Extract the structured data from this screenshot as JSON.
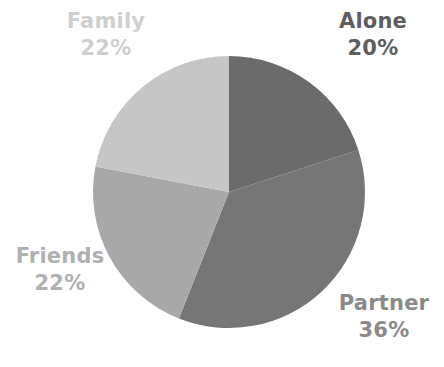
{
  "chart_data": {
    "type": "pie",
    "title": "",
    "subtitle": "",
    "xlabel": "",
    "ylabel": "",
    "legend_position": "none",
    "grid": false,
    "labels_shown": "category-and-percent",
    "start_angle_deg": 0,
    "direction": "clockwise",
    "background_color": "#ffffff",
    "categories": [
      "Alone",
      "Partner",
      "Friends",
      "Family"
    ],
    "values": [
      20,
      36,
      22,
      22
    ],
    "unit": "%",
    "slices": [
      {
        "label": "Alone",
        "value": 20,
        "value_text": "20%",
        "color": "#6b6b6b",
        "label_color": "#5e5e5e",
        "start_deg": 0,
        "end_deg": 72
      },
      {
        "label": "Partner",
        "value": 36,
        "value_text": "36%",
        "color": "#767676",
        "label_color": "#8a8a8a",
        "start_deg": 72,
        "end_deg": 201.6
      },
      {
        "label": "Friends",
        "value": 22,
        "value_text": "22%",
        "color": "#a8a8a8",
        "label_color": "#b0b0b0",
        "start_deg": 201.6,
        "end_deg": 280.8
      },
      {
        "label": "Family",
        "value": 22,
        "value_text": "22%",
        "color": "#c6c6c6",
        "label_color": "#cfcfcf",
        "start_deg": 280.8,
        "end_deg": 360
      }
    ]
  },
  "labels": {
    "alone": {
      "name": "Alone",
      "value": "20%"
    },
    "partner": {
      "name": "Partner",
      "value": "36%"
    },
    "friends": {
      "name": "Friends",
      "value": "22%"
    },
    "family": {
      "name": "Family",
      "value": "22%"
    }
  }
}
